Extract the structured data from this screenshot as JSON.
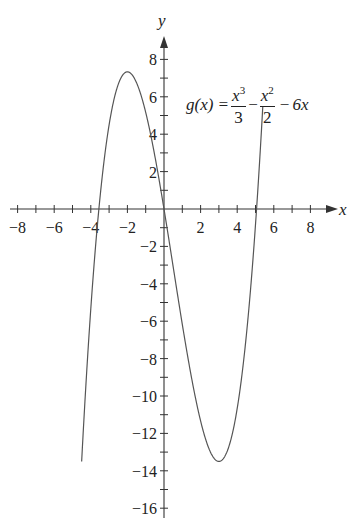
{
  "chart_data": {
    "type": "line",
    "title": "",
    "function_label": "g(x) = x^3/3 - x^2/2 - 6x",
    "formula_parts": {
      "lhs": "g(x) =",
      "term1_num": "x",
      "term1_exp": "3",
      "term1_den": "3",
      "op1": "−",
      "term2_num": "x",
      "term2_exp": "2",
      "term2_den": "2",
      "op2": "−",
      "term3": "6x"
    },
    "xlabel": "x",
    "ylabel": "y",
    "xlim": [
      -9,
      9
    ],
    "ylim": [
      -16.5,
      9
    ],
    "x_ticks": [
      -8,
      -7,
      -6,
      -5,
      -4,
      -3,
      -2,
      -1,
      1,
      2,
      3,
      4,
      5,
      6,
      7,
      8
    ],
    "x_tick_labels": [
      "-8",
      "-6",
      "-4",
      "-2",
      "2",
      "4",
      "6",
      "8"
    ],
    "x_tick_label_values": [
      -8,
      -6,
      -4,
      -2,
      2,
      4,
      6,
      8
    ],
    "y_tick_labels": [
      "8",
      "6",
      "4",
      "2",
      "-2",
      "-4",
      "-6",
      "-8",
      "-10",
      "-12",
      "-14",
      "-16"
    ],
    "y_tick_label_values": [
      8,
      6,
      4,
      2,
      -2,
      -4,
      -6,
      -8,
      -10,
      -12,
      -14,
      -16
    ],
    "grid": false,
    "series": [
      {
        "name": "g(x)",
        "x_range": [
          -4.5,
          5.4
        ],
        "key_points": [
          {
            "x": -4.5,
            "y": -14.6
          },
          {
            "x": -3.8,
            "y": 0.0
          },
          {
            "x": -2,
            "y": 7.33
          },
          {
            "x": 0,
            "y": 0
          },
          {
            "x": 3,
            "y": -13.5
          },
          {
            "x": 4.8,
            "y": 0.0
          },
          {
            "x": 5.4,
            "y": 8.2
          }
        ]
      }
    ],
    "gap_in_curve_for_label": {
      "y_from": 5.6,
      "y_to": 8.0
    }
  }
}
